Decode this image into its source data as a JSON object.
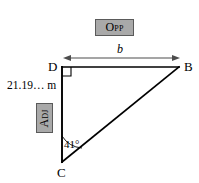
{
  "figure": {
    "kind": "right-triangle-trigonometry-diagram",
    "vertices": [
      {
        "name": "D",
        "label": "D",
        "x": 62,
        "y": 67
      },
      {
        "name": "B",
        "label": "B",
        "x": 179,
        "y": 67
      },
      {
        "name": "C",
        "label": "C",
        "x": 62,
        "y": 162
      }
    ],
    "right_angle": {
      "at": "D",
      "marker": "square",
      "size": 9
    },
    "angle": {
      "at": "C",
      "value": 41,
      "label": "41°",
      "unit": "degrees"
    },
    "sides": {
      "opposite": {
        "from": "D",
        "to": "B",
        "label": "b",
        "tag": "Opp"
      },
      "adjacent": {
        "from": "D",
        "to": "C",
        "label": "21.19… m",
        "tag": "Adj"
      },
      "hypotenuse": {
        "from": "C",
        "to": "B",
        "label": ""
      }
    },
    "dimension_arrow": {
      "label": "b",
      "x1": 63,
      "x2": 180,
      "y": 58,
      "double_headed": true
    },
    "colors": {
      "stroke": "#000000",
      "tag_fill": "#a9a9a9",
      "tag_border": "#5a5a5a",
      "arrow": "#4d4d4d",
      "background": "#ffffff"
    }
  },
  "labels": {
    "vertex_d": "D",
    "vertex_b": "B",
    "vertex_c": "C",
    "side_b": "b",
    "side_adjacent_length": "21.19… m",
    "angle_c": "41°",
    "tag_opposite": "Opp",
    "tag_adjacent": "Adj"
  }
}
